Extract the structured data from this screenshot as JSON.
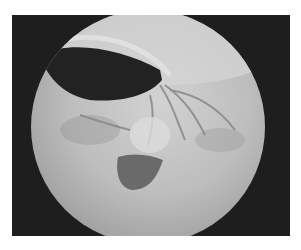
{
  "image": {
    "description": "Grayscale endoscopic view within circular field on dark background",
    "colors": {
      "page_background": "#ffffff",
      "frame_background": "#1e1e1e",
      "field_light": "#c8c8c8",
      "field_mid": "#a9a9a9",
      "dark_lumen": "#262626",
      "blob": "#6e6e6e"
    }
  }
}
